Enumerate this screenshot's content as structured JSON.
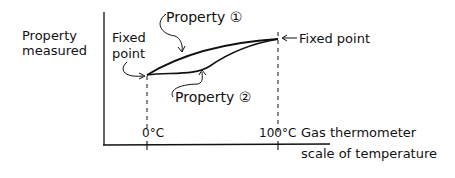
{
  "diagram": {
    "y_axis_label": [
      "Property",
      "measured"
    ],
    "x_axis_label": [
      "Gas thermometer",
      "scale of temperature"
    ],
    "ticks": [
      {
        "label": "0°C"
      },
      {
        "label": "100°C"
      }
    ],
    "annotations": {
      "left_fixed_point": [
        "Fixed",
        "point"
      ],
      "right_fixed_point": "Fixed point",
      "property_1": "Property ①",
      "property_2": "Property ②"
    },
    "curves": [
      {
        "name": "Property 1",
        "shape": "upper curve between fixed points"
      },
      {
        "name": "Property 2",
        "shape": "lower curve between fixed points"
      }
    ],
    "colors": {
      "ink": "#111111",
      "background": "#ffffff"
    }
  }
}
